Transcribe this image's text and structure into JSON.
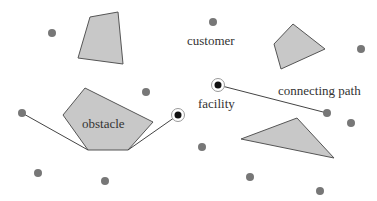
{
  "labels": {
    "customer": "customer",
    "obstacle": "obstacle",
    "facility": "facility",
    "connecting_path": "connecting path"
  },
  "colors": {
    "obstacle_fill": "#c8c8c8",
    "obstacle_stroke": "#555555",
    "customer_dot": "#777777",
    "facility_dot": "#111111",
    "path": "#444444"
  }
}
